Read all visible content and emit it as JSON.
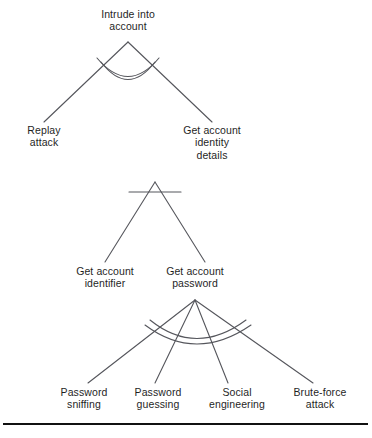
{
  "figure": {
    "name": "attack-tree-intrude-into-account",
    "background_color": "#ffffff",
    "line_color": "#55565c",
    "text_color": "#1f1f1f",
    "rule_color": "#111111"
  },
  "nodes": {
    "root": {
      "id": "intrude-into-account",
      "label": "Intrude into\naccount",
      "gate": "OR"
    },
    "replay_attack": {
      "id": "replay-attack",
      "label": "Replay\nattack",
      "gate": "leaf"
    },
    "get_account_identity_details": {
      "id": "get-account-identity-details",
      "label": "Get account\nidentity\ndetails",
      "gate": "AND"
    },
    "get_account_identifier": {
      "id": "get-account-identifier",
      "label": "Get account\nidentifier",
      "gate": "leaf"
    },
    "get_account_password": {
      "id": "get-account-password",
      "label": "Get account\npassword",
      "gate": "OR"
    },
    "password_sniffing": {
      "id": "password-sniffing",
      "label": "Password\nsniffing",
      "gate": "leaf"
    },
    "password_guessing": {
      "id": "password-guessing",
      "label": "Password\nguessing",
      "gate": "leaf"
    },
    "social_engineering": {
      "id": "social-engineering",
      "label": "Social\nengineering",
      "gate": "leaf"
    },
    "brute_force_attack": {
      "id": "brute-force-attack",
      "label": "Brute-force\nattack",
      "gate": "leaf"
    }
  },
  "gates": {
    "root_or": {
      "type": "OR",
      "notation": "double-arc",
      "parent": "intrude-into-account",
      "children": [
        "replay-attack",
        "get-account-identity-details"
      ]
    },
    "identity_and": {
      "type": "AND",
      "notation": "horizontal-bar",
      "parent": "get-account-identity-details",
      "children": [
        "get-account-identifier",
        "get-account-password"
      ]
    },
    "password_or": {
      "type": "OR",
      "notation": "double-arc",
      "parent": "get-account-password",
      "children": [
        "password-sniffing",
        "password-guessing",
        "social-engineering",
        "brute-force-attack"
      ]
    }
  }
}
